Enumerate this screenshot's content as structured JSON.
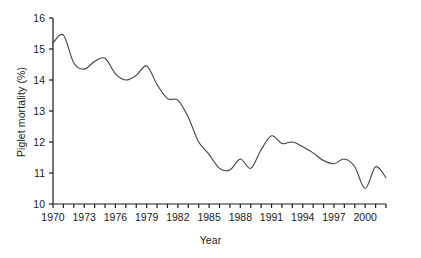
{
  "chart_data": {
    "type": "line",
    "title": "",
    "xlabel": "Year",
    "ylabel": "Piglet mortality (%)",
    "xlim": [
      1970,
      2002
    ],
    "ylim": [
      10,
      16
    ],
    "grid": false,
    "legend": null,
    "line_color": "#404040",
    "background_color": "#ffffff",
    "y_ticks": [
      10,
      11,
      12,
      13,
      14,
      15,
      16
    ],
    "y_tick_labels": [
      "10",
      "11",
      "12",
      "13",
      "14",
      "15",
      "16"
    ],
    "x_ticks": [
      1970,
      1971,
      1972,
      1973,
      1974,
      1975,
      1976,
      1977,
      1978,
      1979,
      1980,
      1981,
      1982,
      1983,
      1984,
      1985,
      1986,
      1987,
      1988,
      1989,
      1990,
      1991,
      1992,
      1993,
      1994,
      1995,
      1996,
      1997,
      1998,
      1999,
      2000,
      2001,
      2002
    ],
    "x_tick_labels": [
      "1970",
      "",
      "",
      "1973",
      "",
      "",
      "1976",
      "",
      "",
      "1979",
      "",
      "",
      "1982",
      "",
      "",
      "1985",
      "",
      "",
      "1988",
      "",
      "",
      "1991",
      "",
      "",
      "1994",
      "",
      "",
      "1997",
      "",
      "",
      "2000",
      "",
      ""
    ],
    "x": [
      1970,
      1971,
      1972,
      1973,
      1974,
      1975,
      1976,
      1977,
      1978,
      1979,
      1980,
      1981,
      1982,
      1983,
      1984,
      1985,
      1986,
      1987,
      1988,
      1989,
      1990,
      1991,
      1992,
      1993,
      1994,
      1995,
      1996,
      1997,
      1998,
      1999,
      2000,
      2001,
      2002
    ],
    "values": [
      15.2,
      15.45,
      14.55,
      14.35,
      14.6,
      14.7,
      14.2,
      14.0,
      14.15,
      14.45,
      13.85,
      13.4,
      13.35,
      12.8,
      12.0,
      11.6,
      11.15,
      11.1,
      11.45,
      11.15,
      11.75,
      12.2,
      11.95,
      12.0,
      11.85,
      11.65,
      11.4,
      11.3,
      11.45,
      11.2,
      10.5,
      11.2,
      10.85
    ],
    "series_name": "Piglet mortality"
  },
  "axes": {
    "y_title": "Piglet mortality (%)",
    "x_title": "Year"
  }
}
